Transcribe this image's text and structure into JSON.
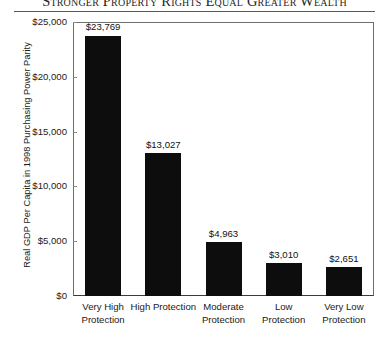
{
  "chart_data": {
    "type": "bar",
    "title": "Stronger Property Rights Equal Greater Wealth",
    "xlabel": "",
    "ylabel": "Real GDP Per Capita in 1998 Purchasing Power Parity",
    "categories": [
      "Very High Protection",
      "High Protection",
      "Moderate Protection",
      "Low Protection",
      "Very Low Protection"
    ],
    "values": [
      23769,
      13027,
      4963,
      3010,
      2651
    ],
    "value_labels": [
      "$23,769",
      "$13,027",
      "$4,963",
      "$3,010",
      "$2,651"
    ],
    "ylim": [
      0,
      25000
    ],
    "ytick_values": [
      0,
      5000,
      10000,
      15000,
      20000,
      25000
    ],
    "ytick_labels": [
      "$0",
      "$5,000",
      "$10,000",
      "$15,000",
      "$20,000",
      "$25,000"
    ],
    "grid": false,
    "legend": false,
    "bar_color": "#0d0d0d",
    "axis_color": "#6e6e6e",
    "text_color": "#1a1a1a",
    "background": "#ffffff"
  },
  "category_lines": [
    [
      "Very High",
      "Protection"
    ],
    [
      "High Protection",
      ""
    ],
    [
      "Moderate",
      "Protection"
    ],
    [
      "Low",
      "Protection"
    ],
    [
      "Very Low",
      "Protection"
    ]
  ]
}
